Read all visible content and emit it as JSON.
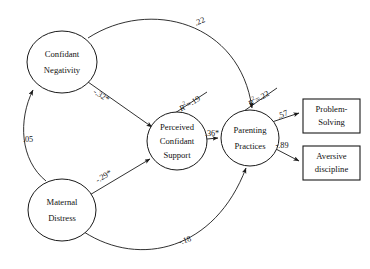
{
  "diagram": {
    "type": "path-diagram",
    "title": "",
    "latent_nodes": [
      {
        "id": "confidant-negativity",
        "label_line1": "Confidant",
        "label_line2": "Negativity",
        "cx": 62,
        "cy": 62,
        "rx": 35,
        "ry": 31
      },
      {
        "id": "perceived-confidant-support",
        "label_line1": "Perceived",
        "label_line2": "Confidant",
        "label_line3": "Support",
        "cx": 177,
        "cy": 141,
        "rx": 30,
        "ry": 29
      },
      {
        "id": "parenting-practices",
        "label_line1": "Parenting",
        "label_line2": "Practices",
        "cx": 250,
        "cy": 138,
        "rx": 29,
        "ry": 28
      },
      {
        "id": "maternal-distress",
        "label_line1": "Maternal",
        "label_line2": "Distress",
        "cx": 62,
        "cy": 210,
        "rx": 34,
        "ry": 31
      }
    ],
    "observed_nodes": [
      {
        "id": "problem-solving",
        "label_line1": "Problem-",
        "label_line2": "Solving",
        "x": 303,
        "y": 99,
        "w": 57,
        "h": 34
      },
      {
        "id": "aversive-discipline",
        "label_line1": "Aversive",
        "label_line2": "discipline",
        "x": 303,
        "y": 146,
        "w": 57,
        "h": 34
      }
    ],
    "paths": [
      {
        "id": "confidant-negativity-to-parenting-practices",
        "from": "confidant-negativity",
        "to": "parenting-practices",
        "coefficient": ".22",
        "label_x": 200,
        "label_y": 22,
        "label_rotate": -22
      },
      {
        "id": "confidant-negativity-to-perceived-support",
        "from": "confidant-negativity",
        "to": "perceived-confidant-support",
        "coefficient": "-.32*",
        "label_x": 101,
        "label_y": 96,
        "label_rotate": 33
      },
      {
        "id": "maternal-distress-to-confidant-negativity",
        "from": "maternal-distress",
        "to": "confidant-negativity",
        "coefficient": ".05",
        "label_x": 28,
        "label_y": 140,
        "label_rotate": 0
      },
      {
        "id": "maternal-distress-to-perceived-support",
        "from": "maternal-distress",
        "to": "perceived-confidant-support",
        "coefficient": "-.29*",
        "label_x": 104,
        "label_y": 177,
        "label_rotate": -32
      },
      {
        "id": "maternal-distress-to-parenting-practices",
        "from": "maternal-distress",
        "to": "parenting-practices",
        "coefficient": "-.18",
        "label_x": 185,
        "label_y": 241,
        "label_rotate": -18
      },
      {
        "id": "perceived-support-to-parenting-practices",
        "from": "perceived-confidant-support",
        "to": "parenting-practices",
        "coefficient": ".36*",
        "label_x": 212,
        "label_y": 134,
        "label_rotate": 0
      },
      {
        "id": "parenting-practices-to-problem-solving",
        "from": "parenting-practices",
        "to": "problem-solving",
        "coefficient": ".57",
        "label_x": 283,
        "label_y": 115,
        "label_rotate": -22
      },
      {
        "id": "parenting-practices-to-aversive-discipline",
        "from": "parenting-practices",
        "to": "aversive-discipline",
        "coefficient": "-.89",
        "label_x": 282,
        "label_y": 146,
        "label_rotate": 0
      }
    ],
    "r_squared": [
      {
        "id": "r2-perceived-confidant-support",
        "target": "perceived-confidant-support",
        "symbol": "R",
        "exponent": "2",
        "equals": "=.19",
        "label_x": 190,
        "label_y": 104,
        "label_rotate": -30
      },
      {
        "id": "r2-parenting-practices",
        "target": "parenting-practices",
        "symbol": "R",
        "exponent": "2",
        "equals": "=.22",
        "label_x": 259,
        "label_y": 99,
        "label_rotate": -30
      }
    ],
    "colors": {
      "stroke": "#1a1a1a",
      "text": "#111111",
      "background": "#ffffff"
    }
  }
}
